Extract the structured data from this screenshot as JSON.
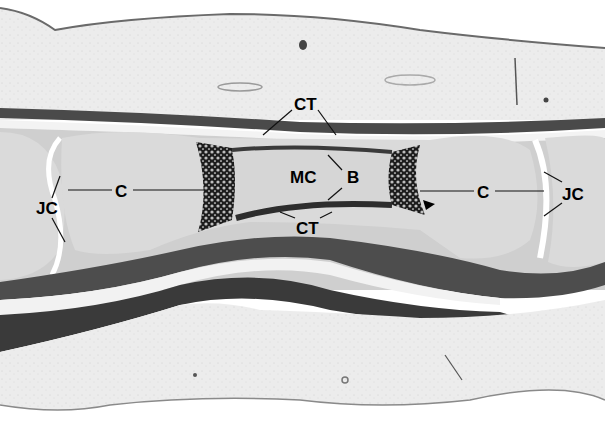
{
  "figure": {
    "type": "histology micrograph (grayscale)",
    "labels": {
      "ct_top": "CT",
      "ct_bottom": "CT",
      "mc": "MC",
      "b": "B",
      "c_left": "C",
      "c_right": "C",
      "jc_left": "JC",
      "jc_right": "JC"
    },
    "annotations": {
      "arrowhead": "arrowhead pointing to ossification front (right)"
    },
    "colors": {
      "background": "#ffffff",
      "dermis": "#e9e9e9",
      "epidermis_line": "#6a6a6a",
      "tendon_dark": "#3c3c3c",
      "cartilage": "#d9d9d9",
      "ossification": "#1e1e1e",
      "marrow": "#d2d2d2",
      "label_text": "#000000"
    }
  }
}
